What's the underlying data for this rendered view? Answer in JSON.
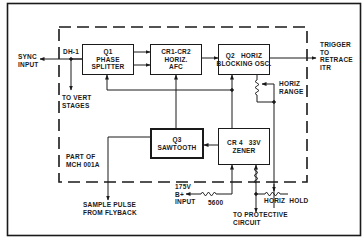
{
  "diagram": {
    "blocks": [
      {
        "id": "q1",
        "label": "Q1\nPHASE\nSPLITTER"
      },
      {
        "id": "cr1cr2",
        "label": "CR1-CR2\nHORIZ.\nAFC"
      },
      {
        "id": "q2",
        "label": "Q2   HORIZ\nBLOCKING OSC."
      },
      {
        "id": "q3",
        "label": "Q3\nSAWTOOTH"
      },
      {
        "id": "cr4",
        "label": "CR 4   33V\nZENER"
      }
    ],
    "labels": {
      "sync_input": "SYNC\nINPUT",
      "dh1": "DH-1",
      "to_vert": "TO VERT\nSTAGES",
      "trigger": "TRIGGER\nTO\nRETRACE\nITR",
      "horiz_range": "HORIZ\nRANGE",
      "part_of": "PART OF\nMCH 001A",
      "sample_pulse": "SAMPLE PULSE\nFROM FLYBACK",
      "b_plus": "175V\nB+\nINPUT",
      "resistor_value": "5600",
      "to_protective": "TO PROTECTIVE\nCIRCUIT",
      "horiz_hold": "HORIZ  HOLD"
    },
    "colors": {
      "ink": "#1a1a1a",
      "background": "#ffffff"
    }
  }
}
